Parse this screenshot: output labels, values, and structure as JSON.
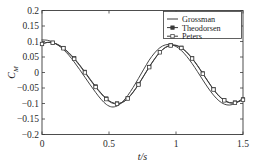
{
  "chart_data": {
    "type": "line",
    "title": "",
    "xlabel": "t/s",
    "ylabel": "C_M",
    "ylabel_base": "C",
    "ylabel_sub": "M",
    "xlim": [
      0,
      1.5
    ],
    "ylim": [
      -0.2,
      0.2
    ],
    "grid": false,
    "legend_position": "top-right",
    "xticks": [
      0,
      0.5,
      1,
      1.5
    ],
    "xticklabels": [
      "0",
      "0.5",
      "1",
      "1.5"
    ],
    "yticks": [
      0.2,
      0.15,
      0.1,
      0.05,
      0,
      -0.05,
      -0.1,
      -0.15,
      -0.2
    ],
    "yticklabels": [
      "0.2",
      "0.15",
      "0.1",
      "0.05",
      "0",
      "−0.05",
      "−0.1",
      "−0.15",
      "−0.2"
    ],
    "series": [
      {
        "name": "Grossman",
        "marker": "none",
        "color": "#3a3a3a",
        "x": [
          0,
          0.04,
          0.08,
          0.12,
          0.16,
          0.2,
          0.24,
          0.28,
          0.32,
          0.36,
          0.4,
          0.44,
          0.48,
          0.52,
          0.56,
          0.6,
          0.64,
          0.68,
          0.72,
          0.76,
          0.8,
          0.84,
          0.88,
          0.92,
          0.96,
          1.0,
          1.04,
          1.08,
          1.12,
          1.16,
          1.2,
          1.24,
          1.28,
          1.32,
          1.36,
          1.4,
          1.44,
          1.48,
          1.5
        ],
        "y": [
          0.105,
          0.104,
          0.098,
          0.088,
          0.074,
          0.056,
          0.034,
          0.01,
          -0.015,
          -0.04,
          -0.064,
          -0.086,
          -0.103,
          -0.111,
          -0.108,
          -0.095,
          -0.074,
          -0.048,
          -0.019,
          0.011,
          0.04,
          0.063,
          0.08,
          0.089,
          0.09,
          0.084,
          0.071,
          0.052,
          0.029,
          0.003,
          -0.024,
          -0.05,
          -0.073,
          -0.091,
          -0.102,
          -0.105,
          -0.1,
          -0.089,
          -0.082
        ]
      },
      {
        "name": "Theodorsen",
        "marker": "filled-square",
        "color": "#3a3a3a",
        "x": [
          0,
          0.04,
          0.08,
          0.12,
          0.16,
          0.2,
          0.24,
          0.28,
          0.32,
          0.36,
          0.4,
          0.44,
          0.48,
          0.52,
          0.56,
          0.6,
          0.64,
          0.68,
          0.72,
          0.76,
          0.8,
          0.84,
          0.88,
          0.92,
          0.96,
          1.0,
          1.04,
          1.08,
          1.12,
          1.16,
          1.2,
          1.24,
          1.28,
          1.32,
          1.36,
          1.4,
          1.44,
          1.48,
          1.5
        ],
        "y": [
          0.092,
          0.097,
          0.096,
          0.09,
          0.079,
          0.064,
          0.046,
          0.025,
          0.002,
          -0.022,
          -0.045,
          -0.066,
          -0.084,
          -0.096,
          -0.1,
          -0.096,
          -0.083,
          -0.063,
          -0.038,
          -0.01,
          0.018,
          0.044,
          0.066,
          0.081,
          0.088,
          0.088,
          0.08,
          0.066,
          0.046,
          0.023,
          -0.003,
          -0.029,
          -0.054,
          -0.075,
          -0.089,
          -0.097,
          -0.097,
          -0.091,
          -0.087
        ]
      },
      {
        "name": "Peters",
        "marker": "open-square",
        "color": "#3a3a3a",
        "x": [
          0,
          0.04,
          0.08,
          0.12,
          0.16,
          0.2,
          0.24,
          0.28,
          0.32,
          0.36,
          0.4,
          0.44,
          0.48,
          0.52,
          0.56,
          0.6,
          0.64,
          0.68,
          0.72,
          0.76,
          0.8,
          0.84,
          0.88,
          0.92,
          0.96,
          1.0,
          1.04,
          1.08,
          1.12,
          1.16,
          1.2,
          1.24,
          1.28,
          1.32,
          1.36,
          1.4,
          1.44,
          1.48,
          1.5
        ],
        "y": [
          0.092,
          0.097,
          0.096,
          0.089,
          0.078,
          0.062,
          0.044,
          0.023,
          0.0,
          -0.024,
          -0.047,
          -0.068,
          -0.086,
          -0.098,
          -0.101,
          -0.097,
          -0.084,
          -0.064,
          -0.039,
          -0.011,
          0.017,
          0.043,
          0.065,
          0.08,
          0.087,
          0.087,
          0.079,
          0.065,
          0.045,
          0.022,
          -0.004,
          -0.03,
          -0.055,
          -0.076,
          -0.09,
          -0.098,
          -0.098,
          -0.092,
          -0.088
        ]
      }
    ]
  },
  "legend": {
    "entries": [
      {
        "label": "Grossman"
      },
      {
        "label": "Theodorsen"
      },
      {
        "label": "Peters"
      }
    ]
  }
}
